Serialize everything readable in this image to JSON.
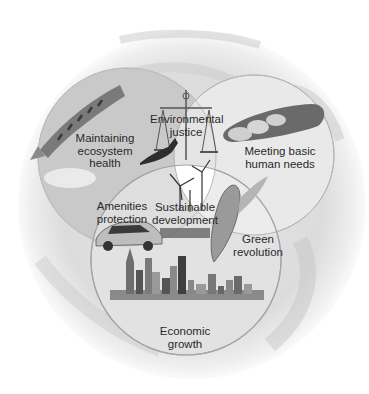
{
  "diagram": {
    "type": "venn",
    "background": "earth-globe",
    "sets": [
      {
        "id": "ecosystem",
        "label": "Maintaining ecosystem health",
        "lines": [
          "Maintaining",
          "ecosystem",
          "health"
        ],
        "image": "salmon-icon"
      },
      {
        "id": "human_needs",
        "label": "Meeting basic human needs",
        "lines": [
          "Meeting basic",
          "human needs"
        ],
        "image": "bread-icon"
      },
      {
        "id": "economic",
        "label": "Economic growth",
        "lines": [
          "Economic",
          "growth"
        ],
        "image": "city-skyline-icon"
      }
    ],
    "intersections": [
      {
        "sets": [
          "ecosystem",
          "human_needs"
        ],
        "label": "Environmental justice",
        "lines": [
          "Environmental",
          "justice"
        ],
        "image": "scales-of-justice-icon"
      },
      {
        "sets": [
          "ecosystem",
          "economic"
        ],
        "label": "Amenities protection",
        "lines": [
          "Amenities",
          "protection"
        ],
        "image": "car-icon"
      },
      {
        "sets": [
          "human_needs",
          "economic"
        ],
        "label": "Green revolution",
        "lines": [
          "Green",
          "revolution"
        ],
        "image": "corn-icon"
      },
      {
        "sets": [
          "ecosystem",
          "human_needs",
          "economic"
        ],
        "label": "Sustainable development",
        "lines": [
          "Sustainable",
          "development"
        ],
        "image": "wind-turbine-icon"
      }
    ],
    "extra_images": [
      "bird-icon"
    ]
  },
  "colors": {
    "globe": "#d9d9d9",
    "ecosystem_fill": "#c9c9c9",
    "human_needs_fill": "#e9e9e9",
    "economic_fill": "#e2e2e2",
    "center_fill": "#ffffff",
    "outline": "#a8a8a8",
    "text": "#2a2a2a"
  }
}
